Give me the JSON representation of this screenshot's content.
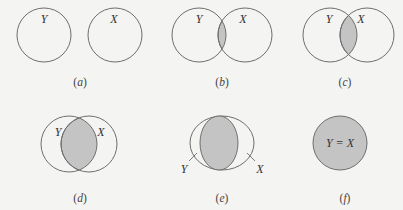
{
  "colors": {
    "background": "#f4f4f2",
    "stroke": "#6e6e6e",
    "shade": "#c4c4c4"
  },
  "panels": [
    {
      "id": "a",
      "caption": "(a)",
      "caption_letter": "a",
      "labels": {
        "left": "Y",
        "right": "X"
      },
      "description": "Disjoint sets Y and X, no overlap"
    },
    {
      "id": "b",
      "caption": "(b)",
      "caption_letter": "b",
      "labels": {
        "left": "Y",
        "right": "X"
      },
      "description": "Small overlap shaded"
    },
    {
      "id": "c",
      "caption": "(c)",
      "caption_letter": "c",
      "labels": {
        "left": "Y",
        "right": "X"
      },
      "description": "Larger overlap shaded"
    },
    {
      "id": "d",
      "caption": "(d)",
      "caption_letter": "d",
      "labels": {
        "left": "Y",
        "right": "X"
      },
      "description": "Large overlap shaded"
    },
    {
      "id": "e",
      "caption": "(e)",
      "caption_letter": "e",
      "labels": {
        "left": "Y",
        "right": "X"
      },
      "description": "Nearly coincident sets, overlap shaded, labels with leader lines"
    },
    {
      "id": "f",
      "caption": "(f)",
      "caption_letter": "f",
      "labels": {
        "center": "Y = X"
      },
      "description": "Identical sets, fully shaded"
    }
  ]
}
